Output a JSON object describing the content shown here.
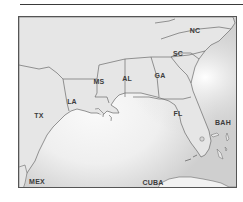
{
  "map": {
    "title": "",
    "colors": {
      "land": "#e6e6e6",
      "water_light": "#f4f4f4",
      "water_dark": "#c9c9c9",
      "border": "#6a6a6a",
      "frame": "#555555",
      "label": "#3c3c3c",
      "rule": "#3a3a3a"
    },
    "labels": [
      {
        "id": "nc",
        "text": "NC",
        "x": 195,
        "y": 30,
        "type": "state"
      },
      {
        "id": "sc",
        "text": "SC",
        "x": 178,
        "y": 53,
        "type": "state"
      },
      {
        "id": "ga",
        "text": "GA",
        "x": 160,
        "y": 75,
        "type": "state"
      },
      {
        "id": "al",
        "text": "AL",
        "x": 127,
        "y": 78,
        "type": "state"
      },
      {
        "id": "ms",
        "text": "MS",
        "x": 99,
        "y": 81,
        "type": "state"
      },
      {
        "id": "la",
        "text": "LA",
        "x": 72,
        "y": 101,
        "type": "state"
      },
      {
        "id": "tx",
        "text": "TX",
        "x": 39,
        "y": 115,
        "type": "state"
      },
      {
        "id": "fl",
        "text": "FL",
        "x": 178,
        "y": 113,
        "type": "state"
      },
      {
        "id": "bah",
        "text": "BAH",
        "x": 223,
        "y": 122,
        "type": "country"
      },
      {
        "id": "mex",
        "text": "MEX",
        "x": 37,
        "y": 181,
        "type": "country"
      },
      {
        "id": "cuba",
        "text": "CUBA",
        "x": 153,
        "y": 182,
        "type": "country"
      }
    ]
  }
}
